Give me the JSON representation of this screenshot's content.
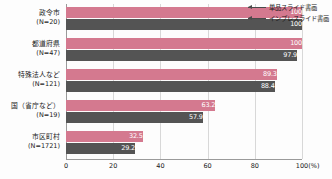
{
  "chart_data": {
    "type": "bar",
    "orientation": "horizontal",
    "title": "",
    "xlabel": "100(%)",
    "ylabel": "",
    "xlim": [
      0,
      100
    ],
    "xticks": [
      0,
      20,
      40,
      60,
      80,
      100
    ],
    "xtick_labels": [
      "0",
      "20",
      "40",
      "60",
      "80",
      "100(%)"
    ],
    "grid": true,
    "legend_position": "top-right",
    "categories": [
      "政令市",
      "都道府県",
      "特殊法人など",
      "国（省庁など）",
      "市区町村"
    ],
    "category_counts": [
      "(N=20)",
      "(N=47)",
      "(N=121)",
      "(N=19)",
      "(N=1721)"
    ],
    "series": [
      {
        "name": "単品スライド書画",
        "color": "#d4798f",
        "values": [
          100,
          100,
          89.3,
          63.2,
          32.5
        ],
        "labels": [
          "100",
          "100",
          "89.3",
          "63.2",
          "32.5"
        ]
      },
      {
        "name": "インプレスライド書画",
        "color": "#545454",
        "values": [
          100,
          97.9,
          88.4,
          57.9,
          29.2
        ],
        "labels": [
          "100",
          "97.9",
          "88.4",
          "57.9",
          "29.2"
        ]
      }
    ]
  },
  "legend": {
    "items": [
      {
        "label": "単品スライド書画"
      },
      {
        "label": "インプレスライド書画"
      }
    ]
  }
}
